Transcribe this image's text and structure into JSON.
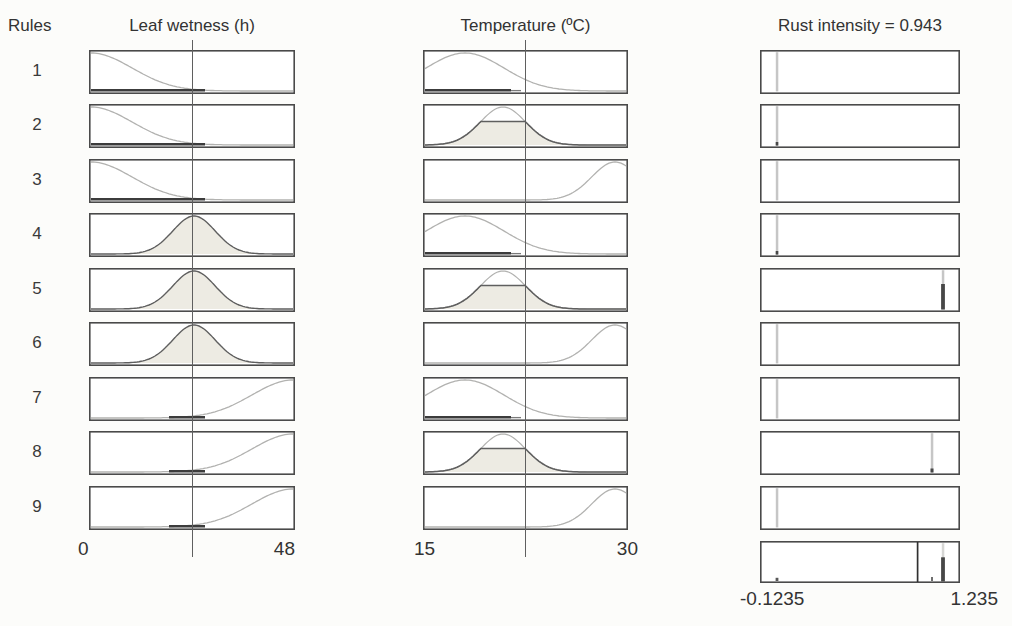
{
  "header": {
    "rules_label": "Rules",
    "col1_title": "Leaf wetness (h)",
    "col2_title": "Temperature (ºC)",
    "col3_title": "Rust intensity = 0.943"
  },
  "axes": {
    "leaf_wetness": {
      "min": "0",
      "max": "48"
    },
    "temperature": {
      "min": "15",
      "max": "30"
    },
    "rust_intensity": {
      "min": "-0.1235",
      "max": "1.235"
    }
  },
  "rows": [
    {
      "num": "1",
      "lw": "low",
      "temp": "low",
      "out": "left-none"
    },
    {
      "num": "2",
      "lw": "low",
      "temp": "mid",
      "out": "left-dot"
    },
    {
      "num": "3",
      "lw": "low",
      "temp": "high",
      "out": "left-none"
    },
    {
      "num": "4",
      "lw": "mid",
      "temp": "low",
      "out": "left-dot"
    },
    {
      "num": "5",
      "lw": "mid",
      "temp": "mid",
      "out": "right-strong"
    },
    {
      "num": "6",
      "lw": "mid",
      "temp": "high",
      "out": "left-none"
    },
    {
      "num": "7",
      "lw": "high",
      "temp": "low",
      "out": "left-none"
    },
    {
      "num": "8",
      "lw": "high",
      "temp": "mid",
      "out": "right-weak"
    },
    {
      "num": "9",
      "lw": "high",
      "temp": "high",
      "out": "left-none"
    }
  ],
  "output_marks": {
    "left_x_pct": 8.5,
    "right_strong_x_pct": 91.5,
    "right_weak_x_pct": 86,
    "aggregate": {
      "defuzz_line_pct": 78.8,
      "bar_pct": 91.5,
      "bar_fill_pct": 62,
      "small_mark_pct": 86,
      "dot_pct": 8.5
    }
  },
  "colors": {
    "border": "#4a4a4a",
    "curve_light": "#b2b2b0",
    "curve_dark": "#5f5f5f",
    "fill": "#edebe3",
    "strong": "#3c3c3c",
    "stripe": "#c6c6c6",
    "mark_dark": "#474747",
    "input_line": "#5f5f5f",
    "text": "#2e2e2e"
  },
  "chart_data": {
    "type": "line",
    "note": "9 fuzzy rules; each row shows membership functions for two inputs and the rule output; bottom-right box shows aggregated output with defuzzified value line",
    "inputs": [
      {
        "name": "Leaf wetness (h)",
        "range": [
          0,
          48
        ],
        "input_value_pct_of_axis": 50.5
      },
      {
        "name": "Temperature (ºC)",
        "range": [
          15,
          30
        ],
        "input_value_pct_of_axis": 50.2
      }
    ],
    "output": {
      "name": "Rust intensity",
      "range": [
        -0.1235,
        1.235
      ],
      "defuzzified_value": 0.943
    },
    "rules": [
      {
        "rule": 1,
        "leaf_wetness_mf": "low (z-curve)",
        "temperature_mf": "low (left gaussian)",
        "output": "singleton near 0, not fired"
      },
      {
        "rule": 2,
        "leaf_wetness_mf": "low (z-curve)",
        "temperature_mf": "medium (clipped gaussian ~0.6)",
        "output": "singleton near 0, tiny firing"
      },
      {
        "rule": 3,
        "leaf_wetness_mf": "low (z-curve)",
        "temperature_mf": "high (right gaussian)",
        "output": "singleton near 0, not fired"
      },
      {
        "rule": 4,
        "leaf_wetness_mf": "medium (gaussian, fired)",
        "temperature_mf": "low (left gaussian)",
        "output": "singleton near 0, tiny firing"
      },
      {
        "rule": 5,
        "leaf_wetness_mf": "medium (gaussian, fired)",
        "temperature_mf": "medium (clipped gaussian ~0.6)",
        "output": "singleton near 1.1, strong firing ~0.6"
      },
      {
        "rule": 6,
        "leaf_wetness_mf": "medium (gaussian, fired)",
        "temperature_mf": "high (right gaussian)",
        "output": "singleton near 0, not fired"
      },
      {
        "rule": 7,
        "leaf_wetness_mf": "high (s-curve)",
        "temperature_mf": "low (left gaussian)",
        "output": "singleton near 0, not fired"
      },
      {
        "rule": 8,
        "leaf_wetness_mf": "high (s-curve)",
        "temperature_mf": "medium (clipped gaussian ~0.6)",
        "output": "singleton near 1.03, weak firing"
      },
      {
        "rule": 9,
        "leaf_wetness_mf": "high (s-curve)",
        "temperature_mf": "high (right gaussian)",
        "output": "singleton near 0, not fired"
      }
    ]
  }
}
